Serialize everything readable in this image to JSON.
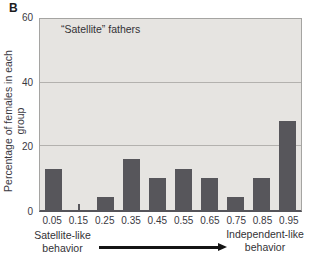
{
  "panel_label": "B",
  "chart_data": {
    "type": "bar",
    "title": "“Satellite” fathers",
    "xlabel": "",
    "ylabel": "Percentage of females in each group",
    "categories": [
      "0.05",
      "0.15",
      "0.25",
      "0.35",
      "0.45",
      "0.55",
      "0.65",
      "0.75",
      "0.85",
      "0.95"
    ],
    "values": [
      13,
      2,
      4,
      16,
      10,
      13,
      10,
      4,
      10,
      28
    ],
    "ylim": [
      0,
      60
    ],
    "yticks": [
      0,
      20,
      40,
      60
    ],
    "grid": true,
    "legend": "none",
    "bar_color": "#57565b",
    "plot_bg": "#e6e4e1",
    "bar_widths_px": [
      17,
      2,
      17,
      17,
      17,
      17,
      17,
      17,
      17,
      17
    ]
  },
  "footer": {
    "left_label_line1": "Satellite-like",
    "left_label_line2": "behavior",
    "right_label_line1": "Independent-like",
    "right_label_line2": "behavior"
  }
}
